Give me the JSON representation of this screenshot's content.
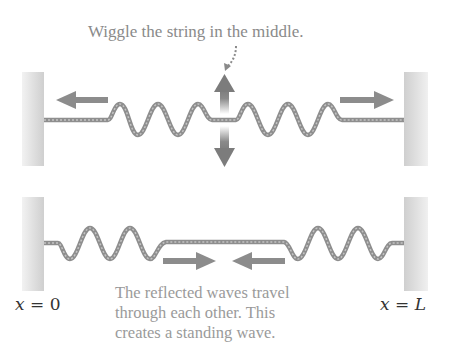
{
  "diagram": {
    "top_panel": {
      "caption": "Wiggle the string in the middle.",
      "description": "Pulse generated at center travels outward in both directions toward the fixed walls",
      "arrows": [
        "left-travel-arrow",
        "right-travel-arrow",
        "vertical-wiggle-arrow"
      ]
    },
    "bottom_panel": {
      "caption_lines": [
        "The reflected waves travel",
        "through each other. This",
        "creates a standing wave."
      ],
      "description": "Reflected waves travel back toward the center",
      "arrows": [
        "right-pointing-arrow",
        "left-pointing-arrow"
      ]
    },
    "labels": {
      "left_boundary_var": "x",
      "left_boundary_eq": " = 0",
      "right_boundary_var": "x",
      "right_boundary_eq": " = L"
    },
    "colors": {
      "string": "#9a9a9a",
      "string_dark": "#7a7a7a",
      "arrow": "#8c8c8c",
      "wall": "#d8d8d8",
      "caption": "#8a8a8a",
      "axis_label": "#333333"
    }
  }
}
